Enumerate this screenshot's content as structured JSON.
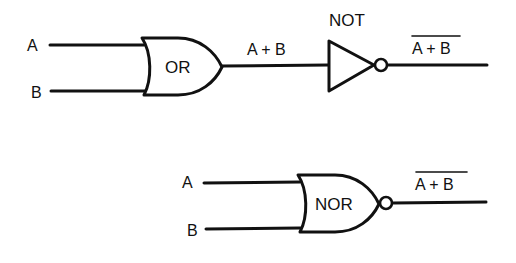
{
  "diagram": {
    "top_circuit": {
      "inputs": [
        {
          "label": "A"
        },
        {
          "label": "B"
        }
      ],
      "or_gate": {
        "label": "OR"
      },
      "intermediate_signal": {
        "label": "A + B"
      },
      "not_gate": {
        "label": "NOT"
      },
      "output": {
        "label": "A + B",
        "overbar": true
      }
    },
    "bottom_circuit": {
      "inputs": [
        {
          "label": "A"
        },
        {
          "label": "B"
        }
      ],
      "nor_gate": {
        "label": "NOR"
      },
      "output": {
        "label": "A + B",
        "overbar": true
      }
    }
  }
}
